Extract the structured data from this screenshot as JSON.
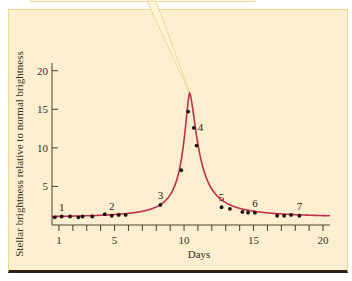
{
  "chart_data": {
    "type": "line",
    "title": "",
    "xlabel": "Days",
    "ylabel": "Stellar brightness relative to normal brightness",
    "xlim": [
      0.5,
      20.5
    ],
    "ylim": [
      0,
      21
    ],
    "xticks_major": [
      1,
      5,
      10,
      15,
      20
    ],
    "xticks_minor": [
      1,
      2,
      3,
      4,
      5,
      6,
      7,
      8,
      9,
      10,
      11,
      12,
      13,
      14,
      15,
      16,
      17,
      18,
      19,
      20
    ],
    "yticks": [
      5,
      10,
      15,
      20
    ],
    "grid": false,
    "curve_color": "#c0304a",
    "point_color": "#1a1410",
    "peak": {
      "day": 10.4,
      "brightness": 17.1
    },
    "points": [
      {
        "day": 0.7,
        "brightness": 1.0
      },
      {
        "day": 1.2,
        "brightness": 1.1
      },
      {
        "day": 1.8,
        "brightness": 1.1
      },
      {
        "day": 2.4,
        "brightness": 1.0
      },
      {
        "day": 2.7,
        "brightness": 1.1
      },
      {
        "day": 3.4,
        "brightness": 1.1
      },
      {
        "day": 4.3,
        "brightness": 1.4
      },
      {
        "day": 4.8,
        "brightness": 1.2
      },
      {
        "day": 5.3,
        "brightness": 1.3
      },
      {
        "day": 5.8,
        "brightness": 1.3
      },
      {
        "day": 8.3,
        "brightness": 2.6
      },
      {
        "day": 9.8,
        "brightness": 7.1
      },
      {
        "day": 10.3,
        "brightness": 14.7
      },
      {
        "day": 10.7,
        "brightness": 12.6
      },
      {
        "day": 10.9,
        "brightness": 10.3
      },
      {
        "day": 12.7,
        "brightness": 2.3
      },
      {
        "day": 13.3,
        "brightness": 2.1
      },
      {
        "day": 14.2,
        "brightness": 1.7
      },
      {
        "day": 14.6,
        "brightness": 1.6
      },
      {
        "day": 15.1,
        "brightness": 1.6
      },
      {
        "day": 16.7,
        "brightness": 1.2
      },
      {
        "day": 17.2,
        "brightness": 1.2
      },
      {
        "day": 17.7,
        "brightness": 1.3
      },
      {
        "day": 18.3,
        "brightness": 1.2
      }
    ],
    "annotations": [
      {
        "text": "1",
        "day": 1.2,
        "brightness": 1.1
      },
      {
        "text": "2",
        "day": 4.8,
        "brightness": 1.2
      },
      {
        "text": "3",
        "day": 8.3,
        "brightness": 2.6
      },
      {
        "text": "4",
        "day": 10.7,
        "brightness": 12.6
      },
      {
        "text": "5",
        "day": 12.7,
        "brightness": 2.3
      },
      {
        "text": "6",
        "day": 15.1,
        "brightness": 1.6
      },
      {
        "text": "7",
        "day": 18.3,
        "brightness": 1.2
      }
    ]
  }
}
